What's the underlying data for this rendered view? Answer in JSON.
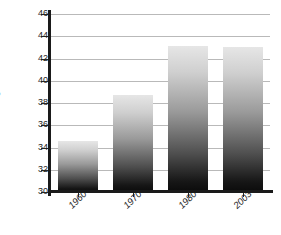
{
  "chart_data": {
    "type": "bar",
    "title": "",
    "xlabel": "",
    "ylabel": "Age",
    "categories": [
      "1960",
      "1970",
      "1980",
      "2003"
    ],
    "values": [
      34.6,
      38.7,
      43.1,
      43.0
    ],
    "ylim": [
      30,
      46
    ],
    "ytick_step": 2,
    "yticks": [
      30,
      32,
      34,
      36,
      38,
      40,
      42,
      44,
      46
    ],
    "ytick_labels": [
      "30",
      "32",
      "34",
      "36",
      "38",
      "40",
      "42",
      "44",
      "46"
    ],
    "grid": true,
    "legend": null,
    "legend_position": "none",
    "series": [
      {
        "name": "Age",
        "values": [
          34.6,
          38.7,
          43.1,
          43.0
        ]
      }
    ],
    "annotations": [],
    "colors": {
      "bar_gradient_top": "#e6e6e6",
      "bar_gradient_bottom": "#0b0b0b",
      "gridline": "#b9b9b9",
      "axis": "#1a1a1a",
      "text": "#1c1c1c",
      "background": "#ffffff"
    }
  }
}
